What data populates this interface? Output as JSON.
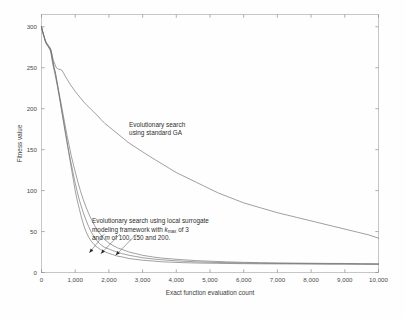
{
  "chart_data": {
    "type": "line",
    "title": "",
    "xlabel": "Exact function evaluation count",
    "ylabel": "Fitness value",
    "xlim": [
      0,
      10000
    ],
    "ylim": [
      0,
      315
    ],
    "grid": false,
    "legend_position": "none",
    "xticks": [
      0,
      1000,
      2000,
      3000,
      4000,
      5000,
      6000,
      7000,
      8000,
      9000,
      10000
    ],
    "xtick_labels": [
      "0",
      "1,000",
      "2,000",
      "3,000",
      "4,000",
      "5,000",
      "6,000",
      "7,000",
      "8,000",
      "9,000",
      "10,000"
    ],
    "yticks": [
      0,
      50,
      100,
      150,
      200,
      250,
      300
    ],
    "ytick_labels": [
      "0",
      "50",
      "100",
      "150",
      "200",
      "250",
      "300"
    ],
    "annotations": [
      {
        "name": "ga-annotation",
        "lines": [
          "Evolutionary search",
          "using standard GA"
        ],
        "x": 2600,
        "y": 178
      },
      {
        "name": "surrogate-annotation",
        "lines": [
          "Evolutionary search using local surrogate",
          "modeling framework with kmax of 3",
          "and m of 100, 150 and 200."
        ],
        "line2_prefix": "modeling framework with ",
        "line2_var": "k",
        "line2_sub": "max",
        "line2_suffix": " of 3",
        "line3_prefix": "and ",
        "line3_var": "m",
        "line3_suffix": " of 100, 150 and 200.",
        "x": 1500,
        "y": 60
      }
    ],
    "series": [
      {
        "name": "Evolutionary search using standard GA",
        "color": "#6a6a6a",
        "x": [
          0,
          20,
          40,
          60,
          80,
          100,
          130,
          160,
          190,
          220,
          250,
          280,
          300,
          320,
          350,
          380,
          400,
          440,
          480,
          520,
          560,
          600,
          650,
          700,
          760,
          820,
          880,
          950,
          1020,
          1100,
          1180,
          1260,
          1350,
          1450,
          1550,
          1650,
          1760,
          1880,
          2000,
          2150,
          2300,
          2450,
          2600,
          2750,
          2900,
          3050,
          3200,
          3400,
          3600,
          3800,
          4000,
          4200,
          4400,
          4600,
          4800,
          5000,
          5250,
          5500,
          5750,
          6000,
          6250,
          6500,
          6750,
          7000,
          7300,
          7600,
          7900,
          8200,
          8500,
          8800,
          9100,
          9400,
          9700,
          10000
        ],
        "y": [
          300,
          297,
          294,
          291,
          288,
          285,
          281,
          279,
          277,
          276,
          275,
          272,
          268,
          264,
          259,
          256,
          254,
          250,
          249,
          248,
          248,
          247,
          244,
          240,
          236,
          232,
          228,
          224,
          220,
          216,
          212,
          208,
          204,
          200,
          196,
          192,
          187,
          182,
          178,
          173,
          168,
          163,
          158,
          154,
          150,
          146,
          142,
          137,
          132,
          127,
          122,
          118,
          114,
          110,
          106,
          102,
          97,
          93,
          89,
          85,
          82,
          79,
          76,
          73,
          70,
          67,
          64,
          61,
          58,
          55,
          52,
          49,
          46,
          42
        ]
      },
      {
        "name": "local surrogate framework, kmax = 3, m = 100",
        "color": "#6e6e6e",
        "x": [
          0,
          20,
          40,
          60,
          80,
          100,
          130,
          160,
          190,
          220,
          250,
          280,
          300,
          320,
          350,
          380,
          400,
          430,
          460,
          500,
          540,
          580,
          620,
          660,
          700,
          750,
          800,
          850,
          900,
          950,
          1000,
          1060,
          1120,
          1180,
          1250,
          1320,
          1400,
          1480,
          1560,
          1650,
          1750,
          1850,
          1950,
          2100,
          2250,
          2400,
          2600,
          2800,
          3000,
          3300,
          3600,
          3900,
          4200,
          4600,
          5000,
          5500,
          6000,
          6500,
          7000,
          7500,
          8000,
          8500,
          9000,
          9500,
          10000
        ],
        "y": [
          300,
          296,
          293,
          290,
          287,
          284,
          280,
          278,
          276,
          274,
          272,
          268,
          263,
          258,
          252,
          248,
          246,
          240,
          232,
          222,
          212,
          202,
          192,
          182,
          172,
          160,
          148,
          136,
          124,
          112,
          100,
          88,
          78,
          68,
          58,
          50,
          43,
          38,
          34,
          31,
          28,
          26,
          24,
          22,
          20,
          19,
          17,
          16,
          15,
          14,
          13,
          12.5,
          12,
          11.6,
          11.3,
          11,
          10.8,
          10.6,
          10.5,
          10.4,
          10.3,
          10.2,
          10.2,
          10.1,
          10
        ]
      },
      {
        "name": "local surrogate framework, kmax = 3, m = 150",
        "color": "#757575",
        "x": [
          0,
          20,
          40,
          60,
          80,
          100,
          130,
          160,
          190,
          220,
          250,
          280,
          300,
          330,
          360,
          400,
          440,
          480,
          520,
          560,
          600,
          650,
          700,
          750,
          800,
          860,
          920,
          980,
          1040,
          1100,
          1170,
          1240,
          1320,
          1400,
          1480,
          1570,
          1660,
          1760,
          1860,
          1980,
          2100,
          2250,
          2400,
          2600,
          2800,
          3000,
          3300,
          3600,
          3900,
          4200,
          4600,
          5000,
          5500,
          6000,
          6500,
          7000,
          7500,
          8000,
          8500,
          9000,
          9500,
          10000
        ],
        "y": [
          300,
          296,
          293,
          290,
          287,
          284,
          281,
          279,
          277,
          275,
          273,
          270,
          265,
          258,
          250,
          242,
          234,
          226,
          217,
          208,
          198,
          186,
          174,
          162,
          150,
          137,
          125,
          113,
          102,
          92,
          82,
          73,
          64,
          56,
          49,
          43,
          38,
          34,
          31,
          29,
          27,
          25,
          23,
          21,
          19.5,
          18,
          16.5,
          15.5,
          14.5,
          13.8,
          13,
          12.5,
          12,
          11.6,
          11.3,
          11.1,
          11,
          10.8,
          10.6,
          10.5,
          10.3,
          10.2
        ]
      },
      {
        "name": "local surrogate framework, kmax = 3, m = 200",
        "color": "#7d7d7d",
        "x": [
          0,
          20,
          40,
          60,
          80,
          100,
          130,
          160,
          190,
          220,
          250,
          280,
          310,
          340,
          380,
          420,
          460,
          500,
          550,
          600,
          650,
          700,
          760,
          820,
          880,
          950,
          1020,
          1090,
          1160,
          1240,
          1320,
          1400,
          1490,
          1580,
          1680,
          1780,
          1880,
          2000,
          2120,
          2260,
          2400,
          2600,
          2800,
          3000,
          3300,
          3600,
          3900,
          4200,
          4600,
          5000,
          5500,
          6000,
          6500,
          7000,
          7500,
          8000,
          8500,
          9000,
          9500,
          10000
        ],
        "y": [
          300,
          296,
          293,
          290,
          288,
          285,
          282,
          280,
          278,
          276,
          274,
          271,
          266,
          259,
          250,
          242,
          233,
          224,
          213,
          202,
          191,
          180,
          167,
          155,
          143,
          131,
          120,
          109,
          99,
          89,
          80,
          72,
          64,
          57,
          50,
          45,
          40,
          36,
          33,
          30,
          28,
          25,
          23,
          21,
          19,
          17.5,
          16.5,
          15.5,
          14.5,
          13.8,
          13,
          12.4,
          12,
          11.7,
          11.5,
          11.3,
          11.1,
          11,
          10.8,
          10.6
        ]
      }
    ],
    "arrows": [
      {
        "name": "arrow-to-m100",
        "from_x": 1870,
        "from_y": 47,
        "to_x": 1420,
        "to_y": 24
      },
      {
        "name": "arrow-to-m150",
        "from_x": 2330,
        "from_y": 47,
        "to_x": 1760,
        "to_y": 23
      },
      {
        "name": "arrow-to-m200",
        "from_x": 2820,
        "from_y": 47,
        "to_x": 2200,
        "to_y": 21
      }
    ]
  }
}
